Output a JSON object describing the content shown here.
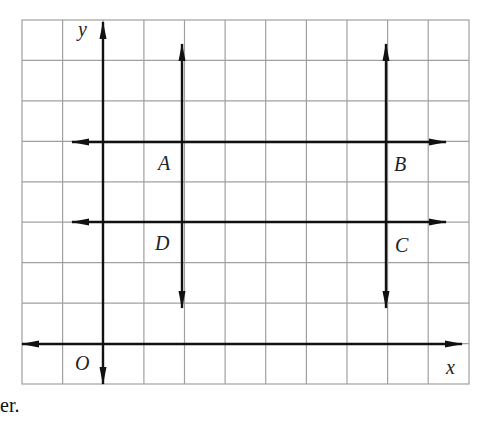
{
  "figure": {
    "grid": {
      "left": 22,
      "top": 20,
      "right": 469,
      "bottom": 384,
      "cols": 11,
      "rows": 9,
      "color": "#9a9a9a"
    },
    "line_color": "#111111",
    "axes": {
      "x_label": "x",
      "y_label": "y",
      "origin_label": "O"
    },
    "points": [
      {
        "name": "A",
        "label": "A"
      },
      {
        "name": "B",
        "label": "B"
      },
      {
        "name": "C",
        "label": "C"
      },
      {
        "name": "D",
        "label": "D"
      }
    ],
    "lines": [
      {
        "id": "y-axis",
        "orientation": "vertical",
        "arrows": "both"
      },
      {
        "id": "x-axis",
        "orientation": "horizontal",
        "arrows": "both"
      },
      {
        "id": "line-AD",
        "orientation": "vertical",
        "through": [
          "A",
          "D"
        ],
        "arrows": "both"
      },
      {
        "id": "line-BC",
        "orientation": "vertical",
        "through": [
          "B",
          "C"
        ],
        "arrows": "both"
      },
      {
        "id": "line-AB",
        "orientation": "horizontal",
        "through": [
          "A",
          "B"
        ],
        "arrows": "both"
      },
      {
        "id": "line-DC",
        "orientation": "horizontal",
        "through": [
          "D",
          "C"
        ],
        "arrows": "both"
      }
    ]
  },
  "caption_fragment": "er."
}
